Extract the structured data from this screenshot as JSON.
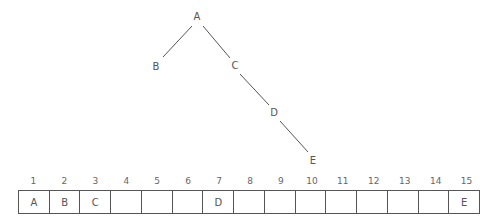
{
  "tree": {
    "nodes": [
      {
        "id": "A",
        "label": "A",
        "x": 197,
        "y": 17
      },
      {
        "id": "B",
        "label": "B",
        "x": 156,
        "y": 67
      },
      {
        "id": "C",
        "label": "C",
        "x": 235,
        "y": 66
      },
      {
        "id": "D",
        "label": "D",
        "x": 274,
        "y": 113
      },
      {
        "id": "E",
        "label": "E",
        "x": 313,
        "y": 161
      }
    ],
    "edges": [
      {
        "from": "A",
        "to": "B",
        "x1": 192,
        "y1": 26,
        "x2": 163,
        "y2": 57
      },
      {
        "from": "A",
        "to": "C",
        "x1": 203,
        "y1": 26,
        "x2": 230,
        "y2": 58
      },
      {
        "from": "C",
        "to": "D",
        "x1": 240,
        "y1": 74,
        "x2": 269,
        "y2": 105
      },
      {
        "from": "D",
        "to": "E",
        "x1": 280,
        "y1": 121,
        "x2": 308,
        "y2": 152
      }
    ]
  },
  "array": {
    "indices": [
      "1",
      "2",
      "3",
      "4",
      "5",
      "6",
      "7",
      "8",
      "9",
      "10",
      "11",
      "12",
      "13",
      "14",
      "15"
    ],
    "cells": [
      "A",
      "B",
      "C",
      "",
      "",
      "",
      "D",
      "",
      "",
      "",
      "",
      "",
      "",
      "",
      "E"
    ]
  }
}
